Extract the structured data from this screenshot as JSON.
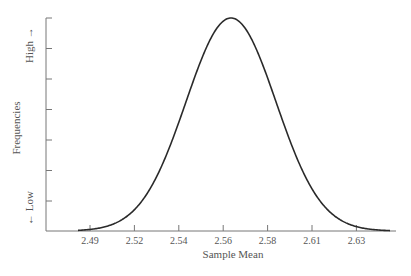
{
  "chart_data": {
    "type": "line",
    "title": "",
    "xlabel": "Sample Mean",
    "ylabel": "Frequencies",
    "y_high_label": "High →",
    "y_low_label": "← Low",
    "x_tick_labels": [
      "2.49",
      "2.52",
      "2.54",
      "2.56",
      "2.58",
      "2.61",
      "2.63"
    ],
    "y_ticks_count": 7,
    "y_tick_labels": [],
    "grid": false,
    "legend": null,
    "distribution": {
      "kind": "normal",
      "mean": 2.5637,
      "std": 0.0215
    },
    "series": [
      {
        "name": "Sampling distribution of the sample mean",
        "x": [
          2.47,
          2.48,
          2.49,
          2.5,
          2.51,
          2.52,
          2.53,
          2.54,
          2.55,
          2.56,
          2.5637,
          2.57,
          2.58,
          2.59,
          2.6,
          2.61,
          2.62,
          2.63,
          2.64,
          2.65
        ],
        "y": [
          0.0,
          0.02,
          0.05,
          0.13,
          0.27,
          0.44,
          0.65,
          0.84,
          0.96,
          0.99,
          1.0,
          0.99,
          0.9,
          0.75,
          0.56,
          0.37,
          0.21,
          0.1,
          0.04,
          0.01
        ]
      }
    ],
    "y_relative": true,
    "xlim": [
      2.468,
      2.657
    ],
    "ylim": [
      0,
      1.0
    ]
  }
}
